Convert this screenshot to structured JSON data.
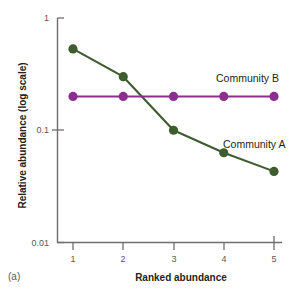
{
  "figure": {
    "panel_letter": "(a)",
    "xlabel": "Ranked abundance",
    "ylabel": "Relative abundance (log scale)"
  },
  "axes": {
    "y_ticks": [
      "1",
      "0.1",
      "0.01"
    ],
    "x_ticks": [
      "1",
      "2",
      "3",
      "4",
      "5"
    ]
  },
  "annotations": {
    "community_a": "Community A",
    "community_b": "Community B"
  },
  "colors": {
    "community_a": "#3f5c2e",
    "community_b": "#8b2e8f",
    "axis": "#6d6e71",
    "text": "#231f20"
  },
  "chart_data": {
    "type": "line",
    "title": "",
    "xlabel": "Ranked abundance",
    "ylabel": "Relative abundance (log scale)",
    "yscale": "log",
    "ylim": [
      0.01,
      1
    ],
    "xlim": [
      1,
      5
    ],
    "grid": false,
    "legend": "inline-annotations",
    "x": [
      1,
      2,
      3,
      4,
      5
    ],
    "series": [
      {
        "name": "Community A",
        "color": "#3f5c2e",
        "values": [
          0.53,
          0.3,
          0.1,
          0.063,
          0.043
        ]
      },
      {
        "name": "Community B",
        "color": "#8b2e8f",
        "values": [
          0.2,
          0.2,
          0.2,
          0.2,
          0.2
        ]
      }
    ]
  }
}
